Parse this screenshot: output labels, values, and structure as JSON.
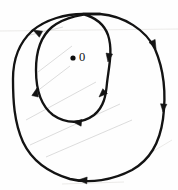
{
  "figure": {
    "background_color": "#fefefe",
    "stroke_color": "#131313",
    "origin_label": "0",
    "origin_point": {
      "x": 73,
      "y": 58,
      "radius": 2.6
    },
    "curve": {
      "name": "limacon-double-loop",
      "description": "Single closed curve that crosses itself near the top, forming a small inner loop and a large outer loop; winding number 2 about the origin",
      "direction": "clockwise",
      "self_intersection": {
        "x": 83,
        "y": 14
      },
      "outer_loop_extents": {
        "left": 13,
        "right": 163,
        "top": 14,
        "bottom": 182
      },
      "inner_loop_extents": {
        "left": 36,
        "right": 112,
        "top": 14,
        "bottom": 122
      }
    },
    "arrowheads": [
      {
        "name": "outer-upper-left",
        "x": 33,
        "y": 30,
        "angle": 205
      },
      {
        "name": "outer-right",
        "x": 156,
        "y": 49,
        "angle": 62
      },
      {
        "name": "outer-lower-right",
        "x": 161,
        "y": 117,
        "angle": 104
      },
      {
        "name": "outer-bottom",
        "x": 78,
        "y": 175,
        "angle": 188
      },
      {
        "name": "inner-right-upper",
        "x": 110,
        "y": 59,
        "angle": 100
      },
      {
        "name": "inner-right-lower",
        "x": 99,
        "y": 92,
        "angle": 133
      },
      {
        "name": "inner-bottom",
        "x": 79,
        "y": 119,
        "angle": 170
      },
      {
        "name": "inner-left",
        "x": 42,
        "y": 93,
        "angle": 274
      }
    ]
  },
  "chart_data": {
    "type": "line",
    "xlabel": "",
    "ylabel": "",
    "grid": false,
    "legend": null,
    "annotations": [
      {
        "text": "0",
        "x": 73,
        "y": 58,
        "marker": "filled-dot"
      }
    ],
    "series": [
      {
        "name": "outer-loop",
        "closed": false,
        "points": [
          [
            83,
            14
          ],
          [
            60,
            16
          ],
          [
            42,
            23
          ],
          [
            27,
            36
          ],
          [
            18,
            54
          ],
          [
            13,
            76
          ],
          [
            13,
            100
          ],
          [
            18,
            125
          ],
          [
            29,
            148
          ],
          [
            46,
            166
          ],
          [
            68,
            177
          ],
          [
            92,
            182
          ],
          [
            116,
            178
          ],
          [
            137,
            166
          ],
          [
            152,
            148
          ],
          [
            161,
            125
          ],
          [
            163,
            100
          ],
          [
            161,
            74
          ],
          [
            153,
            50
          ],
          [
            139,
            31
          ],
          [
            120,
            19
          ],
          [
            100,
            14
          ]
        ]
      },
      {
        "name": "inner-loop",
        "closed": false,
        "points": [
          [
            100,
            14
          ],
          [
            83,
            14
          ],
          [
            66,
            18
          ],
          [
            52,
            27
          ],
          [
            42,
            42
          ],
          [
            37,
            60
          ],
          [
            36,
            80
          ],
          [
            41,
            98
          ],
          [
            52,
            112
          ],
          [
            68,
            121
          ],
          [
            84,
            122
          ],
          [
            97,
            113
          ],
          [
            104,
            99
          ],
          [
            106,
            84
          ],
          [
            110,
            68
          ],
          [
            112,
            52
          ],
          [
            108,
            36
          ],
          [
            98,
            24
          ],
          [
            88,
            17
          ],
          [
            83,
            14
          ]
        ]
      }
    ]
  }
}
